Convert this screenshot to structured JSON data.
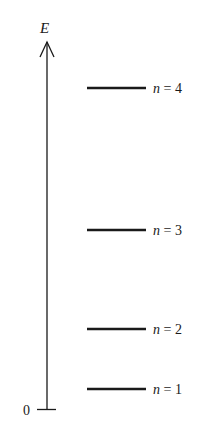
{
  "diagram": {
    "type": "energy-level-diagram",
    "axis": {
      "label": "E",
      "origin_label": "0"
    },
    "levels": [
      {
        "n": 4,
        "label_var": "n",
        "label_eq": " = 4",
        "y": 88
      },
      {
        "n": 3,
        "label_var": "n",
        "label_eq": " = 3",
        "y": 230
      },
      {
        "n": 2,
        "label_var": "n",
        "label_eq": " = 2",
        "y": 329
      },
      {
        "n": 1,
        "label_var": "n",
        "label_eq": " = 1",
        "y": 389
      }
    ],
    "colors": {
      "ink": "#1a1a1a",
      "background": "#ffffff"
    }
  }
}
